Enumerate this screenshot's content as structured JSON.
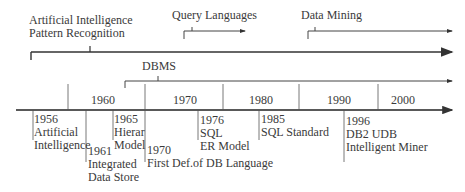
{
  "diagram": {
    "type": "timeline",
    "line_color": "#333333",
    "text_color": "#3a3a3a",
    "tracks": [
      {
        "id": "ai",
        "label_lines": [
          "Artificial Intelligence",
          "Pattern Recognition"
        ]
      },
      {
        "id": "query",
        "label": "Query Languages"
      },
      {
        "id": "mining",
        "label": "Data Mining"
      },
      {
        "id": "dbms",
        "label": "DBMS"
      }
    ],
    "decades": [
      "1960",
      "1970",
      "1980",
      "1990",
      "2000"
    ],
    "events": [
      {
        "year": "1956",
        "lines": [
          "Artificial",
          "Intelligence"
        ]
      },
      {
        "year": "1961",
        "lines": [
          "Integrated",
          "Data Store"
        ]
      },
      {
        "year": "1965",
        "lines": [
          "Hierar",
          "Model"
        ]
      },
      {
        "year": "1970",
        "lines": [
          "First Def.of DB Language"
        ]
      },
      {
        "year": "1976",
        "lines": [
          "SQL",
          "ER Model"
        ]
      },
      {
        "year": "1985",
        "lines": [
          "SQL Standard"
        ]
      },
      {
        "year": "1996",
        "lines": [
          "DB2 UDB",
          "Intelligent Miner"
        ]
      }
    ]
  }
}
